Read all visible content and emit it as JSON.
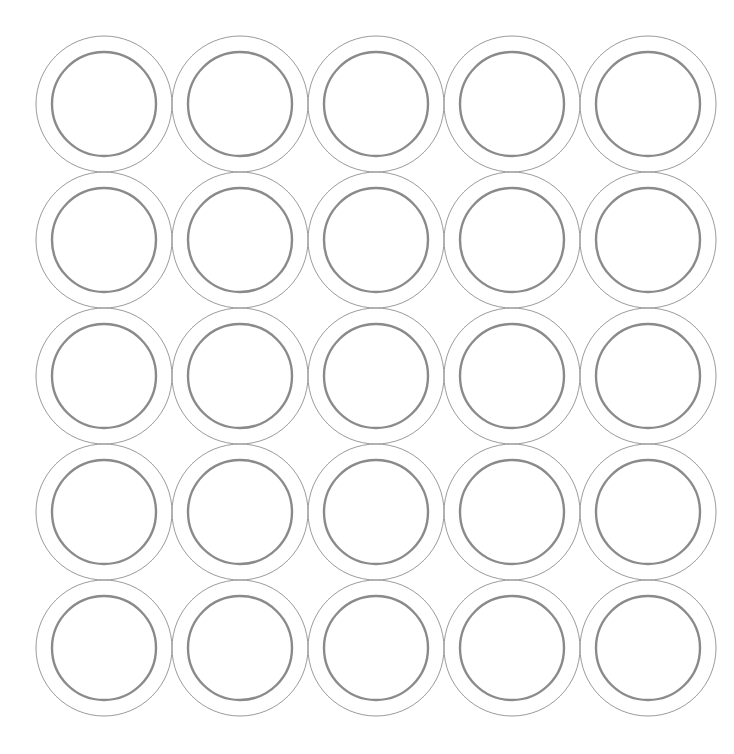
{
  "canvas": {
    "width": 734,
    "height": 754,
    "background_color": "#ffffff",
    "title": "Concentric Circle Grid"
  },
  "pattern": {
    "name": "concentric-ring-grid",
    "rows": 5,
    "columns": 5,
    "total_units": 25,
    "origin_x": 104,
    "origin_y": 104,
    "pitch_x": 136,
    "pitch_y": 136
  },
  "ring_unit": {
    "outer_radius": 68,
    "outer_stroke_color": "#9a9a9a",
    "outer_stroke_width": 1,
    "inner_radius": 52,
    "inner_stroke_color": "#8a8a8a",
    "inner_stroke_width": 2.4,
    "fill": "none"
  },
  "chart_data": {
    "type": "scatter",
    "xlabel": "",
    "ylabel": "",
    "xlim": [
      0,
      734
    ],
    "ylim": [
      0,
      754
    ],
    "grid": false,
    "legend": "none",
    "series": [
      {
        "name": "outer-circles",
        "marker": "circle-outline",
        "radius": 68,
        "color": "#9a9a9a",
        "linewidth": 1,
        "points": [
          {
            "x": 104,
            "y": 104
          },
          {
            "x": 240,
            "y": 104
          },
          {
            "x": 376,
            "y": 104
          },
          {
            "x": 512,
            "y": 104
          },
          {
            "x": 648,
            "y": 104
          },
          {
            "x": 104,
            "y": 240
          },
          {
            "x": 240,
            "y": 240
          },
          {
            "x": 376,
            "y": 240
          },
          {
            "x": 512,
            "y": 240
          },
          {
            "x": 648,
            "y": 240
          },
          {
            "x": 104,
            "y": 376
          },
          {
            "x": 240,
            "y": 376
          },
          {
            "x": 376,
            "y": 376
          },
          {
            "x": 512,
            "y": 376
          },
          {
            "x": 648,
            "y": 376
          },
          {
            "x": 104,
            "y": 512
          },
          {
            "x": 240,
            "y": 512
          },
          {
            "x": 376,
            "y": 512
          },
          {
            "x": 512,
            "y": 512
          },
          {
            "x": 648,
            "y": 512
          },
          {
            "x": 104,
            "y": 648
          },
          {
            "x": 240,
            "y": 648
          },
          {
            "x": 376,
            "y": 648
          },
          {
            "x": 512,
            "y": 648
          },
          {
            "x": 648,
            "y": 648
          }
        ]
      },
      {
        "name": "inner-circles",
        "marker": "circle-outline",
        "radius": 52,
        "color": "#8a8a8a",
        "linewidth": 2.4,
        "points": [
          {
            "x": 104,
            "y": 104
          },
          {
            "x": 240,
            "y": 104
          },
          {
            "x": 376,
            "y": 104
          },
          {
            "x": 512,
            "y": 104
          },
          {
            "x": 648,
            "y": 104
          },
          {
            "x": 104,
            "y": 240
          },
          {
            "x": 240,
            "y": 240
          },
          {
            "x": 376,
            "y": 240
          },
          {
            "x": 512,
            "y": 240
          },
          {
            "x": 648,
            "y": 240
          },
          {
            "x": 104,
            "y": 376
          },
          {
            "x": 240,
            "y": 376
          },
          {
            "x": 376,
            "y": 376
          },
          {
            "x": 512,
            "y": 376
          },
          {
            "x": 648,
            "y": 376
          },
          {
            "x": 104,
            "y": 512
          },
          {
            "x": 240,
            "y": 512
          },
          {
            "x": 376,
            "y": 512
          },
          {
            "x": 512,
            "y": 512
          },
          {
            "x": 648,
            "y": 512
          },
          {
            "x": 104,
            "y": 648
          },
          {
            "x": 240,
            "y": 648
          },
          {
            "x": 376,
            "y": 648
          },
          {
            "x": 512,
            "y": 648
          },
          {
            "x": 648,
            "y": 648
          }
        ]
      }
    ]
  }
}
